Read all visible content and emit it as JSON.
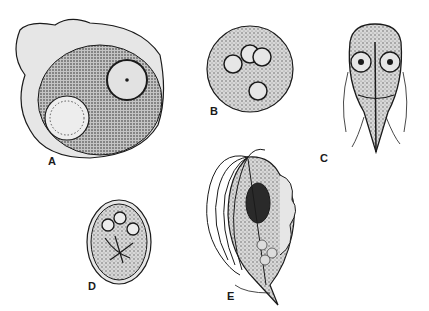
{
  "plate": {
    "figures": [
      {
        "id": "A",
        "label": "A",
        "description": "Large cyst with two nuclei and vacuole"
      },
      {
        "id": "B",
        "label": "B",
        "description": "Round cyst with four nuclei"
      },
      {
        "id": "C",
        "label": "C",
        "description": "Pear-shaped flagellate trophozoite with two nuclei"
      },
      {
        "id": "D",
        "label": "D",
        "description": "Oval cyst with nuclei and axonemes"
      },
      {
        "id": "E",
        "label": "E",
        "description": "Flagellate trophozoite with undulating membrane"
      }
    ]
  },
  "colors": {
    "ink": "#1a1a1a",
    "stipple": "#8a8a8a",
    "fill": "#e6e6e6",
    "background": "#ffffff"
  }
}
